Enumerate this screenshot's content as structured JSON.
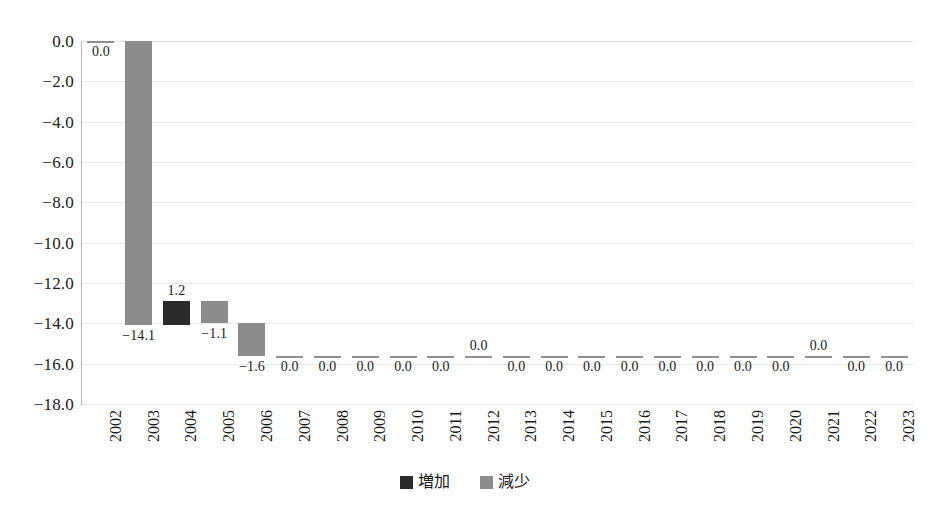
{
  "chart_data": {
    "type": "bar",
    "chart_style": "waterfall",
    "title": "",
    "subtitle": "",
    "xlabel": "",
    "ylabel": "",
    "categories": [
      "2002",
      "2003",
      "2004",
      "2005",
      "2006",
      "2007",
      "2008",
      "2009",
      "2010",
      "2011",
      "2012",
      "2013",
      "2014",
      "2015",
      "2016",
      "2017",
      "2018",
      "2019",
      "2020",
      "2021",
      "2022",
      "2023"
    ],
    "values": [
      0.0,
      -14.1,
      1.2,
      -1.1,
      -1.6,
      0.0,
      0.0,
      0.0,
      0.0,
      0.0,
      0.0,
      0.0,
      0.0,
      0.0,
      0.0,
      0.0,
      0.0,
      0.0,
      0.0,
      0.0,
      0.0,
      0.0
    ],
    "data_labels": [
      "0.0",
      "−14.1",
      "1.2",
      "−1.1",
      "−1.6",
      "0.0",
      "0.0",
      "0.0",
      "0.0",
      "0.0",
      "0.0",
      "0.0",
      "0.0",
      "0.0",
      "0.0",
      "0.0",
      "0.0",
      "0.0",
      "0.0",
      "0.0",
      "0.0",
      "0.0"
    ],
    "label_position": [
      "below",
      "below",
      "above",
      "below",
      "below",
      "below",
      "below",
      "below",
      "below",
      "below",
      "above",
      "below",
      "below",
      "below",
      "below",
      "below",
      "below",
      "below",
      "below",
      "above",
      "below",
      "below"
    ],
    "cumulative_start": [
      0.0,
      0.0,
      -14.1,
      -12.9,
      -14.0,
      -15.6,
      -15.6,
      -15.6,
      -15.6,
      -15.6,
      -15.6,
      -15.6,
      -15.6,
      -15.6,
      -15.6,
      -15.6,
      -15.6,
      -15.6,
      -15.6,
      -15.6,
      -15.6,
      -15.6
    ],
    "cumulative_end": [
      0.0,
      -14.1,
      -12.9,
      -14.0,
      -15.6,
      -15.6,
      -15.6,
      -15.6,
      -15.6,
      -15.6,
      -15.6,
      -15.6,
      -15.6,
      -15.6,
      -15.6,
      -15.6,
      -15.6,
      -15.6,
      -15.6,
      -15.6,
      -15.6,
      -15.6
    ],
    "bar_type": [
      "dec",
      "dec",
      "inc",
      "dec",
      "dec",
      "dec",
      "dec",
      "dec",
      "dec",
      "dec",
      "dec",
      "dec",
      "dec",
      "dec",
      "dec",
      "dec",
      "dec",
      "dec",
      "dec",
      "dec",
      "dec",
      "dec"
    ],
    "ylim": [
      -18.0,
      0.0
    ],
    "yticks": [
      0.0,
      -2.0,
      -4.0,
      -6.0,
      -8.0,
      -10.0,
      -12.0,
      -14.0,
      -16.0,
      -18.0
    ],
    "ytick_labels": [
      "0.0",
      "−2.0",
      "−4.0",
      "−6.0",
      "−8.0",
      "−10.0",
      "−12.0",
      "−14.0",
      "−16.0",
      "−18.0"
    ],
    "grid": true,
    "grid_axis": "y",
    "legend_position": "bottom",
    "legend": [
      {
        "label": "増加",
        "color": "#2b2b2b",
        "key": "increase"
      },
      {
        "label": "減少",
        "color": "#8c8c8c",
        "key": "decrease"
      }
    ]
  },
  "colors": {
    "increase": "#2b2b2b",
    "decrease": "#8c8c8c",
    "grid": "#e9e9e9",
    "axis": "#b8b8b8",
    "background": "#ffffff",
    "text": "#1a1a1a"
  }
}
